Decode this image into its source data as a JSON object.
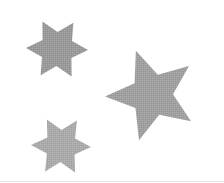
{
  "scene": {
    "description": "Three gray halftone stars on white background",
    "background": "#ffffff",
    "stars": [
      {
        "name": "six-point-star-top-left",
        "points": 6,
        "cx": 57,
        "cy": 49,
        "outer_r": 31,
        "inner_r": 17,
        "rotation_deg": -28,
        "color": "#9a9a9a"
      },
      {
        "name": "five-point-star-right",
        "points": 5,
        "cx": 152,
        "cy": 95,
        "outer_r": 47,
        "inner_r": 21,
        "rotation_deg": -20,
        "color": "#a0a0a0"
      },
      {
        "name": "six-point-star-bottom-left",
        "points": 6,
        "cx": 61,
        "cy": 146,
        "outer_r": 30,
        "inner_r": 16,
        "rotation_deg": -28,
        "color": "#ababab"
      }
    ]
  }
}
